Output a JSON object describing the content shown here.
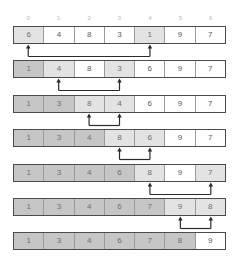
{
  "diagram": {
    "indices": [
      "0",
      "1",
      "2",
      "3",
      "4",
      "5",
      "6"
    ],
    "colors": {
      "border": "#4b4b4b",
      "cell_divider": "#9a9a9a",
      "sorted_fill": "#c6c6c6",
      "active_fill": "#e3e3e3",
      "plain_fill": "#ffffff",
      "index_text": "#b9b9b9",
      "value_text": "#5a5a5a",
      "arrow": "#2b2b2b"
    },
    "steps": [
      {
        "values": [
          "6",
          "4",
          "8",
          "3",
          "1",
          "9",
          "7"
        ],
        "states": [
          "active",
          "plain",
          "plain",
          "plain",
          "active",
          "plain",
          "plain"
        ],
        "arrows": [
          0,
          4
        ]
      },
      {
        "values": [
          "1",
          "4",
          "8",
          "3",
          "6",
          "9",
          "7"
        ],
        "states": [
          "sorted",
          "active",
          "plain",
          "active",
          "plain",
          "plain",
          "plain"
        ],
        "arrows": [
          1,
          3
        ]
      },
      {
        "values": [
          "1",
          "3",
          "8",
          "4",
          "6",
          "9",
          "7"
        ],
        "states": [
          "sorted",
          "sorted",
          "active",
          "active",
          "plain",
          "plain",
          "plain"
        ],
        "arrows": [
          2,
          3
        ]
      },
      {
        "values": [
          "1",
          "3",
          "4",
          "8",
          "6",
          "9",
          "7"
        ],
        "states": [
          "sorted",
          "sorted",
          "sorted",
          "active",
          "active",
          "plain",
          "plain"
        ],
        "arrows": [
          3,
          4
        ]
      },
      {
        "values": [
          "1",
          "3",
          "4",
          "6",
          "8",
          "9",
          "7"
        ],
        "states": [
          "sorted",
          "sorted",
          "sorted",
          "sorted",
          "active",
          "plain",
          "active"
        ],
        "arrows": [
          4,
          6
        ]
      },
      {
        "values": [
          "1",
          "3",
          "4",
          "6",
          "7",
          "9",
          "8"
        ],
        "states": [
          "sorted",
          "sorted",
          "sorted",
          "sorted",
          "sorted",
          "active",
          "active"
        ],
        "arrows": [
          5,
          6
        ]
      },
      {
        "values": [
          "1",
          "3",
          "4",
          "6",
          "7",
          "8",
          "9"
        ],
        "states": [
          "sorted",
          "sorted",
          "sorted",
          "sorted",
          "sorted",
          "sorted",
          "plain"
        ],
        "arrows": []
      }
    ]
  }
}
